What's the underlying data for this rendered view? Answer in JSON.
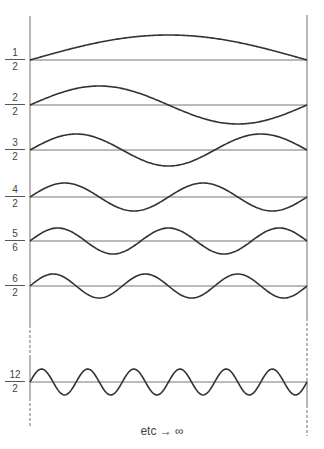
{
  "figure": {
    "caption": "etc → ∞",
    "stroke_color": "#333333",
    "baseline_color": "#777777",
    "wall_color": "#888888",
    "walls": {
      "left_x": 30,
      "right_x": 307
    }
  },
  "modes": [
    {
      "label": {
        "num": "1",
        "den": "2"
      },
      "half_waves": 1,
      "baseline_y": 60,
      "amplitude": 25
    },
    {
      "label": {
        "num": "2",
        "den": "2"
      },
      "half_waves": 2,
      "baseline_y": 105,
      "amplitude": 19
    },
    {
      "label": {
        "num": "3",
        "den": "2"
      },
      "half_waves": 3,
      "baseline_y": 150,
      "amplitude": 16
    },
    {
      "label": {
        "num": "4",
        "den": "2"
      },
      "half_waves": 4,
      "baseline_y": 197,
      "amplitude": 14
    },
    {
      "label": {
        "num": "5",
        "den": "6"
      },
      "half_waves": 5,
      "baseline_y": 241,
      "amplitude": 13
    },
    {
      "label": {
        "num": "6",
        "den": "2"
      },
      "half_waves": 6,
      "baseline_y": 286,
      "amplitude": 12
    },
    {
      "label": {
        "num": "12",
        "den": "2"
      },
      "half_waves": 12,
      "baseline_y": 382,
      "amplitude": 13
    }
  ]
}
